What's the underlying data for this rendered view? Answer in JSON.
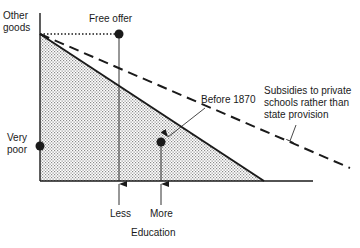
{
  "axes": {
    "y_label": "Other\ngoods",
    "x_label": "Education"
  },
  "points": {
    "free_offer": "Free offer",
    "before_1870": "Before 1870",
    "very_poor": "Very\npoor"
  },
  "annotations": {
    "subsidies": "Subsidies to private\nschools rather than\nstate provision"
  },
  "x_markers": {
    "less": "Less",
    "more": "More"
  },
  "colors": {
    "ink": "#1a1a1a",
    "shade": "#d9d9d9"
  }
}
